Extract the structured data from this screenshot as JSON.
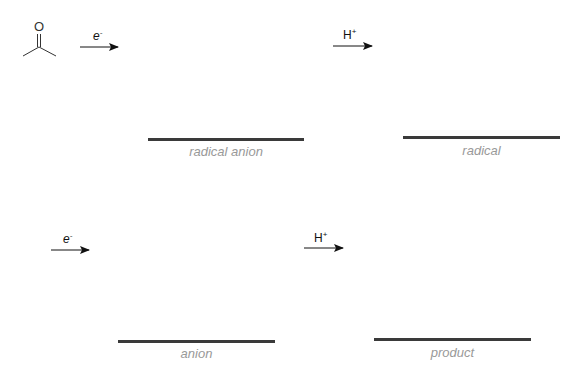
{
  "diagram": {
    "title": "",
    "start_molecule": {
      "name": "acetone",
      "atom_label": "O"
    },
    "steps": [
      {
        "id": "step1",
        "reagent": "e",
        "reagent_sup": "-",
        "reagent_italic": true,
        "product_label": "radical anion"
      },
      {
        "id": "step2",
        "reagent": "H",
        "reagent_sup": "+",
        "reagent_italic": false,
        "product_label": "radical"
      },
      {
        "id": "step3",
        "reagent": "e",
        "reagent_sup": "-",
        "reagent_italic": true,
        "product_label": "anion"
      },
      {
        "id": "step4",
        "reagent": "H",
        "reagent_sup": "+",
        "reagent_italic": false,
        "product_label": "product"
      }
    ],
    "colors": {
      "line": "#3a3a3a",
      "label": "#999999",
      "arrow": "#111111"
    }
  }
}
